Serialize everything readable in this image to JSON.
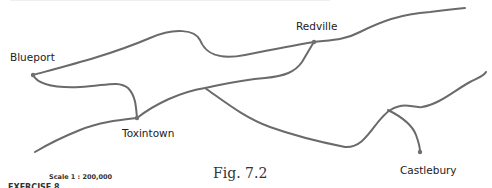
{
  "map": {
    "towns": [
      {
        "name": "Blueport",
        "x": 33,
        "y": 75
      },
      {
        "name": "Redville",
        "x": 314,
        "y": 42
      },
      {
        "name": "Toxintown",
        "x": 137,
        "y": 118
      },
      {
        "name": "Castlebury",
        "x": 420,
        "y": 152
      }
    ],
    "scale": "Scale 1 : 200,000",
    "caption": "Fig. 7.2",
    "footer_cut_text": "EXERCISE 8",
    "road_color": "#6a6a6a"
  }
}
